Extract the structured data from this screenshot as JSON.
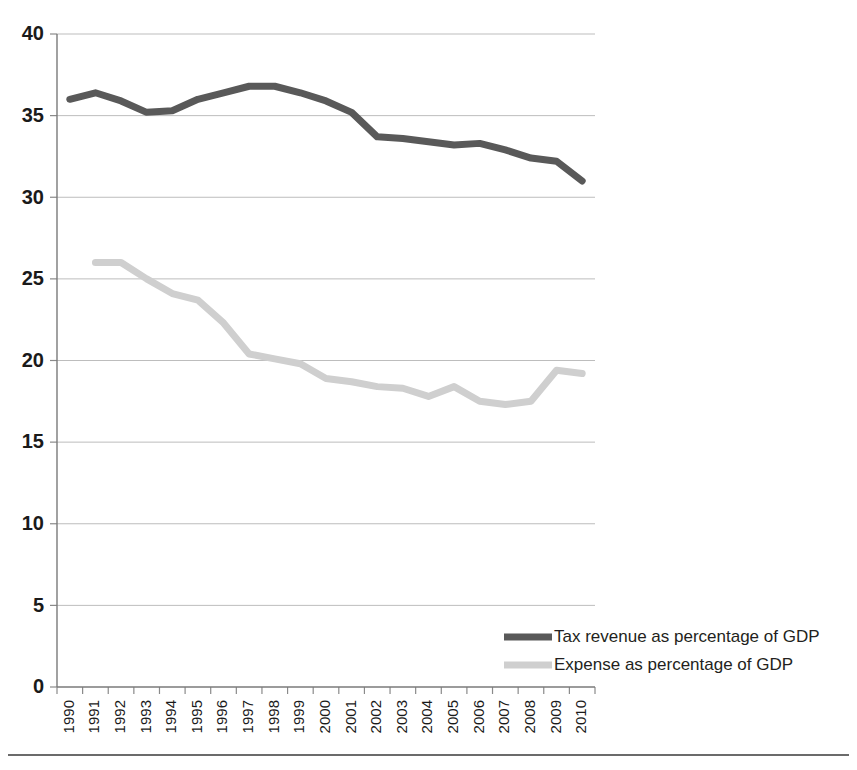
{
  "chart_data": {
    "type": "line",
    "title": "",
    "subtitle": "",
    "xlabel": "",
    "ylabel": "",
    "xlim": [
      1990,
      2010
    ],
    "ylim": [
      0,
      40
    ],
    "grid": true,
    "legend_position": "inside-bottom-right",
    "y_ticks": [
      0,
      5,
      10,
      15,
      20,
      25,
      30,
      35,
      40
    ],
    "y_tick_labels": [
      "0",
      "5",
      "10",
      "15",
      "20",
      "25",
      "30",
      "35",
      "40"
    ],
    "categories": [
      1990,
      1991,
      1992,
      1993,
      1994,
      1995,
      1996,
      1997,
      1998,
      1999,
      2000,
      2001,
      2002,
      2003,
      2004,
      2005,
      2006,
      2007,
      2008,
      2009,
      2010
    ],
    "x_tick_labels": [
      "1990",
      "1991",
      "1992",
      "1993",
      "1994",
      "1995",
      "1996",
      "1997",
      "1998",
      "1999",
      "2000",
      "2001",
      "2002",
      "2003",
      "2004",
      "2005",
      "2006",
      "2007",
      "2008",
      "2009",
      "2010"
    ],
    "series": [
      {
        "name": "Tax revenue as percentage of GDP",
        "color": "#595959",
        "line_width": 7,
        "values": [
          36.0,
          36.4,
          35.9,
          35.2,
          35.3,
          36.0,
          36.4,
          36.8,
          36.8,
          36.4,
          35.9,
          35.2,
          33.7,
          33.6,
          33.4,
          33.2,
          33.3,
          32.9,
          32.4,
          32.2,
          31.0
        ]
      },
      {
        "name": "Expense as percentage of GDP",
        "color": "#cfcfcf",
        "line_width": 7,
        "values": [
          null,
          26.0,
          26.0,
          25.0,
          24.1,
          23.7,
          22.3,
          20.4,
          20.1,
          19.8,
          18.9,
          18.7,
          18.4,
          18.3,
          17.8,
          18.4,
          17.5,
          17.3,
          17.5,
          19.4,
          19.2
        ]
      }
    ]
  },
  "legend": {
    "entries": [
      {
        "label": "Tax revenue as percentage of GDP",
        "color": "#595959"
      },
      {
        "label": "Expense as percentage of GDP",
        "color": "#cfcfcf"
      }
    ]
  }
}
